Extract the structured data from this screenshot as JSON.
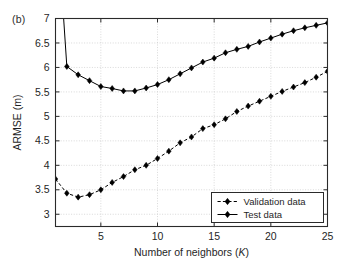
{
  "panel": {
    "label": "(b)"
  },
  "chart_data": {
    "type": "line",
    "title": "",
    "xlabel_prefix": "Number of neighbors (",
    "xlabel_italic": "K",
    "xlabel_suffix": ")",
    "xlabel": "Number of neighbors (K)",
    "ylabel": "ARMSE (m)",
    "xlim": [
      1,
      25
    ],
    "ylim": [
      2.75,
      7
    ],
    "xticks": [
      5,
      10,
      15,
      20,
      25
    ],
    "xtick_labels": [
      "5",
      "10",
      "15",
      "20",
      "25"
    ],
    "yticks": [
      3,
      3.5,
      4,
      4.5,
      5,
      5.5,
      6,
      6.5,
      7
    ],
    "ytick_labels": [
      "3",
      "3.5",
      "4",
      "4.5",
      "5",
      "5.5",
      "6",
      "6.5",
      "7"
    ],
    "grid": true,
    "legend_position": "lower right",
    "x": [
      1,
      2,
      3,
      4,
      5,
      6,
      7,
      8,
      9,
      10,
      11,
      12,
      13,
      14,
      15,
      16,
      17,
      18,
      19,
      20,
      21,
      22,
      23,
      24,
      25
    ],
    "series": [
      {
        "name": "Validation data",
        "linestyle": "dashed",
        "marker": "diamond",
        "color": "#000000",
        "values": [
          3.72,
          3.43,
          3.35,
          3.4,
          3.5,
          3.65,
          3.77,
          3.91,
          4.0,
          4.14,
          4.29,
          4.46,
          4.58,
          4.75,
          4.83,
          4.95,
          5.1,
          5.21,
          5.31,
          5.41,
          5.51,
          5.6,
          5.69,
          5.8,
          5.92
        ]
      },
      {
        "name": "Test data",
        "linestyle": "solid",
        "marker": "diamond",
        "color": "#000000",
        "values": [
          9.5,
          6.02,
          5.85,
          5.73,
          5.61,
          5.57,
          5.52,
          5.52,
          5.58,
          5.65,
          5.75,
          5.87,
          5.99,
          6.11,
          6.19,
          6.3,
          6.37,
          6.43,
          6.52,
          6.6,
          6.68,
          6.75,
          6.81,
          6.86,
          6.91
        ]
      }
    ]
  },
  "legend": {
    "items": [
      {
        "label": "Validation data",
        "style": "dashed"
      },
      {
        "label": "Test data",
        "style": "solid"
      }
    ]
  }
}
